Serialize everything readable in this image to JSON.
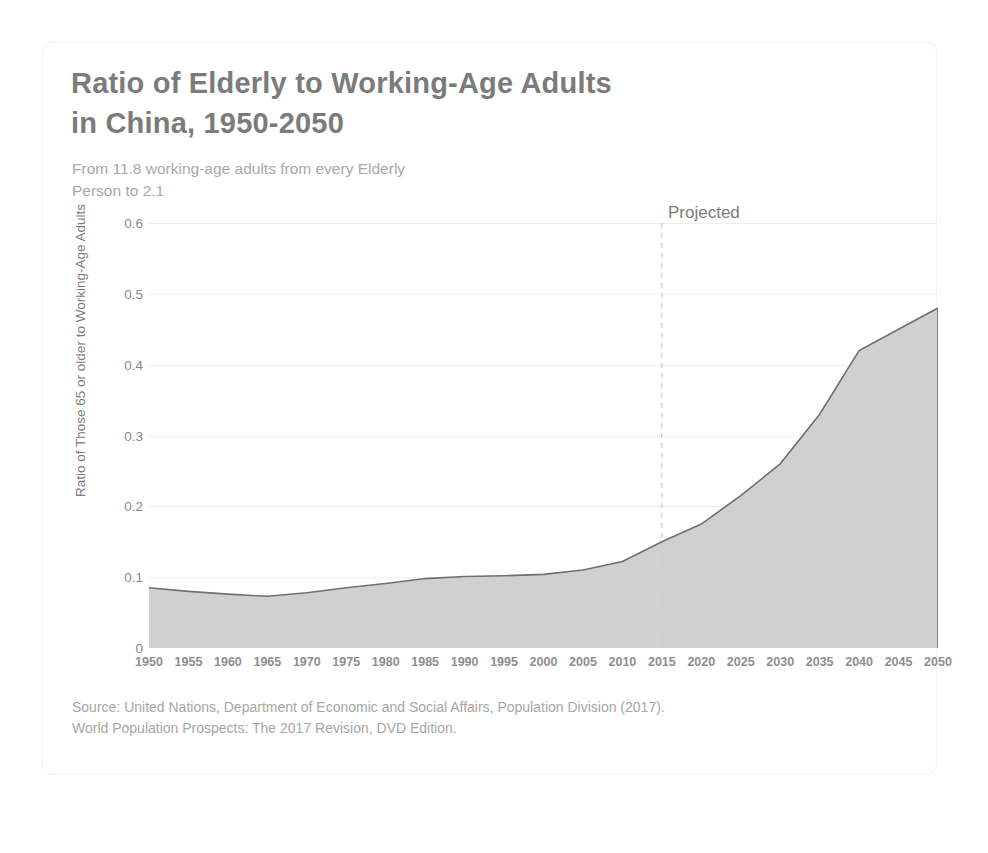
{
  "card": {
    "title_line1": "Ratio of Elderly to Working-Age Adults",
    "title_line2": "in China, 1950-2050",
    "subtitle_line1": "From 11.8 working-age adults from every Elderly",
    "subtitle_line2": "Person to 2.1",
    "source_line1": "Source: United Nations, Department of Economic and Social Affairs, Population Division (2017).",
    "source_line2": "World Population Prospects: The 2017 Revision, DVD Edition."
  },
  "annotations": {
    "projected_label": "Projected",
    "projected_start_year": 2015
  },
  "colors": {
    "title": "#7b7b7b",
    "subtitle": "#a8a8a8",
    "area_fill": "#d0d0d0",
    "line": "#6f6f6f",
    "gridline": "#ececec",
    "axis_text": "#8a8a8a",
    "source_text": "#a6a6a6",
    "card_border": "#f2f2f2",
    "background": "#ffffff"
  },
  "chart_data": {
    "type": "area",
    "title": "Ratio of Elderly to Working-Age Adults in China, 1950-2050",
    "subtitle": "From 11.8 working-age adults from every Elderly Person to 2.1",
    "xlabel": "",
    "ylabel": "Ratio of Those 65 or older to Working-Age Adults",
    "ylim": [
      0,
      0.6
    ],
    "xlim": [
      1950,
      2050
    ],
    "ytick_labels": [
      "0.6",
      "0.5",
      "0.4",
      "0.3",
      "0.2",
      "0.1",
      "0"
    ],
    "ytick_values": [
      0.6,
      0.5,
      0.4,
      0.3,
      0.2,
      0.1,
      0
    ],
    "grid": true,
    "legend": "none",
    "categories": [
      1950,
      1955,
      1960,
      1965,
      1970,
      1975,
      1980,
      1985,
      1990,
      1995,
      2000,
      2005,
      2010,
      2015,
      2020,
      2025,
      2030,
      2035,
      2040,
      2045,
      2050
    ],
    "xtick_labels": [
      "1950",
      "1955",
      "1960",
      "1965",
      "1970",
      "1975",
      "1980",
      "1985",
      "1990",
      "1995",
      "2000",
      "2005",
      "2010",
      "2015",
      "2020",
      "2025",
      "2030",
      "2035",
      "2040",
      "2045",
      "2050"
    ],
    "series": [
      {
        "name": "Ratio of Those 65 or older to Working-Age Adults",
        "values": [
          0.085,
          0.08,
          0.076,
          0.073,
          0.078,
          0.085,
          0.091,
          0.098,
          0.101,
          0.102,
          0.104,
          0.11,
          0.122,
          0.15,
          0.175,
          0.215,
          0.26,
          0.33,
          0.42,
          0.45,
          0.48
        ]
      }
    ]
  }
}
